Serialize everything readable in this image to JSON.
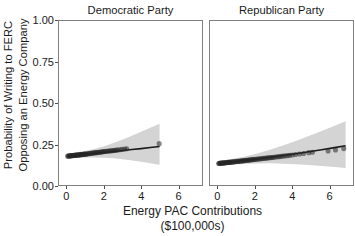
{
  "chart_data": {
    "type": "scatter",
    "title": "",
    "xlabel": "Energy PAC Contributions ($100,000s)",
    "xlabel_line1": "Energy PAC Contributions",
    "xlabel_line2": "($100,000s)",
    "ylabel": "Probability of Writing to FERC Opposing an Energy Company",
    "ylabel_line1": "Probability of Writing to FERC",
    "ylabel_line2": "Opposing an Energy Company",
    "xlim": [
      -0.45,
      7.3
    ],
    "ylim": [
      0.0,
      1.0
    ],
    "xticks": [
      0,
      2,
      4,
      6
    ],
    "xtick_labels": [
      "0",
      "2",
      "4",
      "6"
    ],
    "yticks": [
      0.0,
      0.25,
      0.5,
      0.75,
      1.0
    ],
    "ytick_labels": [
      "0.00",
      "0.25",
      "0.50",
      "0.75",
      "1.00"
    ],
    "grid": false,
    "legend": "none",
    "facet_by": "party",
    "point_color": "#262626",
    "band_color": "#d4d4d4",
    "line_color": "#1a1a1a",
    "panel_border_color": "#808080",
    "panels": [
      {
        "name": "democratic",
        "title": "Democratic Party",
        "fit_line": {
          "x": [
            0.0,
            0.5,
            1.0,
            1.5,
            2.0,
            2.5,
            3.0,
            3.5,
            4.0,
            4.5,
            5.0
          ],
          "y": [
            0.176,
            0.181,
            0.187,
            0.192,
            0.198,
            0.204,
            0.21,
            0.216,
            0.222,
            0.229,
            0.235
          ]
        },
        "ci_upper": {
          "x": [
            0.0,
            0.5,
            1.0,
            1.5,
            2.0,
            2.5,
            3.0,
            3.5,
            4.0,
            4.5,
            5.0
          ],
          "y": [
            0.192,
            0.199,
            0.209,
            0.221,
            0.237,
            0.256,
            0.277,
            0.3,
            0.324,
            0.349,
            0.374
          ]
        },
        "ci_lower": {
          "x": [
            0.0,
            0.5,
            1.0,
            1.5,
            2.0,
            2.5,
            3.0,
            3.5,
            4.0,
            4.5,
            5.0
          ],
          "y": [
            0.161,
            0.164,
            0.167,
            0.168,
            0.166,
            0.163,
            0.157,
            0.15,
            0.142,
            0.133,
            0.124
          ]
        },
        "points": [
          {
            "x": 0.02,
            "y": 0.176
          },
          {
            "x": 0.06,
            "y": 0.177
          },
          {
            "x": 0.1,
            "y": 0.177
          },
          {
            "x": 0.14,
            "y": 0.178
          },
          {
            "x": 0.18,
            "y": 0.178
          },
          {
            "x": 0.22,
            "y": 0.179
          },
          {
            "x": 0.26,
            "y": 0.179
          },
          {
            "x": 0.3,
            "y": 0.18
          },
          {
            "x": 0.34,
            "y": 0.18
          },
          {
            "x": 0.38,
            "y": 0.181
          },
          {
            "x": 0.42,
            "y": 0.181
          },
          {
            "x": 0.46,
            "y": 0.182
          },
          {
            "x": 0.5,
            "y": 0.182
          },
          {
            "x": 0.54,
            "y": 0.183
          },
          {
            "x": 0.58,
            "y": 0.183
          },
          {
            "x": 0.62,
            "y": 0.184
          },
          {
            "x": 0.66,
            "y": 0.184
          },
          {
            "x": 0.7,
            "y": 0.185
          },
          {
            "x": 0.74,
            "y": 0.185
          },
          {
            "x": 0.78,
            "y": 0.186
          },
          {
            "x": 0.82,
            "y": 0.186
          },
          {
            "x": 0.86,
            "y": 0.187
          },
          {
            "x": 0.9,
            "y": 0.187
          },
          {
            "x": 0.94,
            "y": 0.188
          },
          {
            "x": 0.98,
            "y": 0.188
          },
          {
            "x": 1.04,
            "y": 0.189
          },
          {
            "x": 1.1,
            "y": 0.19
          },
          {
            "x": 1.16,
            "y": 0.191
          },
          {
            "x": 1.22,
            "y": 0.192
          },
          {
            "x": 1.28,
            "y": 0.193
          },
          {
            "x": 1.34,
            "y": 0.194
          },
          {
            "x": 1.4,
            "y": 0.195
          },
          {
            "x": 1.46,
            "y": 0.196
          },
          {
            "x": 1.52,
            "y": 0.197
          },
          {
            "x": 1.58,
            "y": 0.197
          },
          {
            "x": 1.64,
            "y": 0.198
          },
          {
            "x": 1.7,
            "y": 0.199
          },
          {
            "x": 1.76,
            "y": 0.2
          },
          {
            "x": 1.82,
            "y": 0.201
          },
          {
            "x": 1.88,
            "y": 0.202
          },
          {
            "x": 1.94,
            "y": 0.203
          },
          {
            "x": 2.0,
            "y": 0.204
          },
          {
            "x": 2.08,
            "y": 0.205
          },
          {
            "x": 2.16,
            "y": 0.206
          },
          {
            "x": 2.24,
            "y": 0.207
          },
          {
            "x": 2.32,
            "y": 0.208
          },
          {
            "x": 2.4,
            "y": 0.209
          },
          {
            "x": 2.48,
            "y": 0.21
          },
          {
            "x": 2.56,
            "y": 0.211
          },
          {
            "x": 2.64,
            "y": 0.212
          },
          {
            "x": 2.72,
            "y": 0.214
          },
          {
            "x": 2.84,
            "y": 0.215
          },
          {
            "x": 2.96,
            "y": 0.217
          },
          {
            "x": 3.1,
            "y": 0.219
          },
          {
            "x": 3.22,
            "y": 0.221
          },
          {
            "x": 4.98,
            "y": 0.252
          }
        ]
      },
      {
        "name": "republican",
        "title": "Republican Party",
        "fit_line": {
          "x": [
            0.0,
            0.7,
            1.4,
            2.1,
            2.8,
            3.5,
            4.2,
            4.9,
            5.6,
            6.3,
            6.9
          ],
          "y": [
            0.131,
            0.14,
            0.149,
            0.159,
            0.169,
            0.18,
            0.191,
            0.203,
            0.215,
            0.228,
            0.239
          ]
        },
        "ci_upper": {
          "x": [
            0.0,
            0.7,
            1.4,
            2.1,
            2.8,
            3.5,
            4.2,
            4.9,
            5.6,
            6.3,
            6.9
          ],
          "y": [
            0.146,
            0.158,
            0.173,
            0.192,
            0.215,
            0.241,
            0.269,
            0.299,
            0.33,
            0.361,
            0.388
          ]
        },
        "ci_lower": {
          "x": [
            0.0,
            0.7,
            1.4,
            2.1,
            2.8,
            3.5,
            4.2,
            4.9,
            5.6,
            6.3,
            6.9
          ],
          "y": [
            0.117,
            0.123,
            0.128,
            0.131,
            0.132,
            0.13,
            0.127,
            0.122,
            0.116,
            0.11,
            0.104
          ]
        },
        "points": [
          {
            "x": 0.02,
            "y": 0.131
          },
          {
            "x": 0.06,
            "y": 0.132
          },
          {
            "x": 0.1,
            "y": 0.132
          },
          {
            "x": 0.14,
            "y": 0.133
          },
          {
            "x": 0.18,
            "y": 0.133
          },
          {
            "x": 0.22,
            "y": 0.134
          },
          {
            "x": 0.26,
            "y": 0.134
          },
          {
            "x": 0.3,
            "y": 0.135
          },
          {
            "x": 0.34,
            "y": 0.135
          },
          {
            "x": 0.38,
            "y": 0.136
          },
          {
            "x": 0.42,
            "y": 0.136
          },
          {
            "x": 0.46,
            "y": 0.137
          },
          {
            "x": 0.5,
            "y": 0.137
          },
          {
            "x": 0.54,
            "y": 0.138
          },
          {
            "x": 0.58,
            "y": 0.138
          },
          {
            "x": 0.62,
            "y": 0.139
          },
          {
            "x": 0.66,
            "y": 0.139
          },
          {
            "x": 0.7,
            "y": 0.14
          },
          {
            "x": 0.76,
            "y": 0.141
          },
          {
            "x": 0.82,
            "y": 0.141
          },
          {
            "x": 0.88,
            "y": 0.142
          },
          {
            "x": 0.94,
            "y": 0.143
          },
          {
            "x": 1.0,
            "y": 0.144
          },
          {
            "x": 1.06,
            "y": 0.144
          },
          {
            "x": 1.12,
            "y": 0.145
          },
          {
            "x": 1.18,
            "y": 0.146
          },
          {
            "x": 1.24,
            "y": 0.147
          },
          {
            "x": 1.3,
            "y": 0.147
          },
          {
            "x": 1.36,
            "y": 0.148
          },
          {
            "x": 1.42,
            "y": 0.149
          },
          {
            "x": 1.48,
            "y": 0.15
          },
          {
            "x": 1.54,
            "y": 0.151
          },
          {
            "x": 1.6,
            "y": 0.151
          },
          {
            "x": 1.66,
            "y": 0.152
          },
          {
            "x": 1.72,
            "y": 0.153
          },
          {
            "x": 1.78,
            "y": 0.154
          },
          {
            "x": 1.84,
            "y": 0.155
          },
          {
            "x": 1.9,
            "y": 0.155
          },
          {
            "x": 1.96,
            "y": 0.156
          },
          {
            "x": 2.04,
            "y": 0.157
          },
          {
            "x": 2.12,
            "y": 0.158
          },
          {
            "x": 2.2,
            "y": 0.159
          },
          {
            "x": 2.28,
            "y": 0.16
          },
          {
            "x": 2.36,
            "y": 0.161
          },
          {
            "x": 2.44,
            "y": 0.162
          },
          {
            "x": 2.52,
            "y": 0.163
          },
          {
            "x": 2.6,
            "y": 0.164
          },
          {
            "x": 2.68,
            "y": 0.165
          },
          {
            "x": 2.76,
            "y": 0.166
          },
          {
            "x": 2.84,
            "y": 0.167
          },
          {
            "x": 2.92,
            "y": 0.168
          },
          {
            "x": 3.0,
            "y": 0.169
          },
          {
            "x": 3.1,
            "y": 0.171
          },
          {
            "x": 3.2,
            "y": 0.172
          },
          {
            "x": 3.3,
            "y": 0.173
          },
          {
            "x": 3.4,
            "y": 0.175
          },
          {
            "x": 3.5,
            "y": 0.176
          },
          {
            "x": 3.62,
            "y": 0.178
          },
          {
            "x": 3.74,
            "y": 0.179
          },
          {
            "x": 3.86,
            "y": 0.181
          },
          {
            "x": 4.0,
            "y": 0.183
          },
          {
            "x": 4.18,
            "y": 0.186
          },
          {
            "x": 4.4,
            "y": 0.189
          },
          {
            "x": 4.62,
            "y": 0.192
          },
          {
            "x": 4.9,
            "y": 0.197
          },
          {
            "x": 5.1,
            "y": 0.2
          },
          {
            "x": 5.95,
            "y": 0.207
          },
          {
            "x": 6.35,
            "y": 0.214
          },
          {
            "x": 6.8,
            "y": 0.222
          }
        ]
      }
    ]
  }
}
